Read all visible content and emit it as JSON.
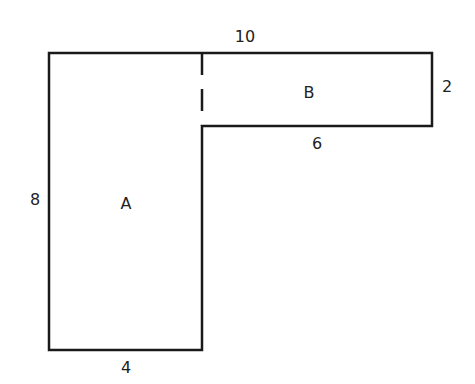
{
  "diagram": {
    "type": "composite-shape",
    "regions": [
      {
        "id": "A",
        "label": "A"
      },
      {
        "id": "B",
        "label": "B"
      }
    ],
    "dimensions": {
      "top": "10",
      "right": "2",
      "inner_bottom_b": "6",
      "left": "8",
      "bottom": "4"
    },
    "stroke_color": "#1a1a1a"
  }
}
